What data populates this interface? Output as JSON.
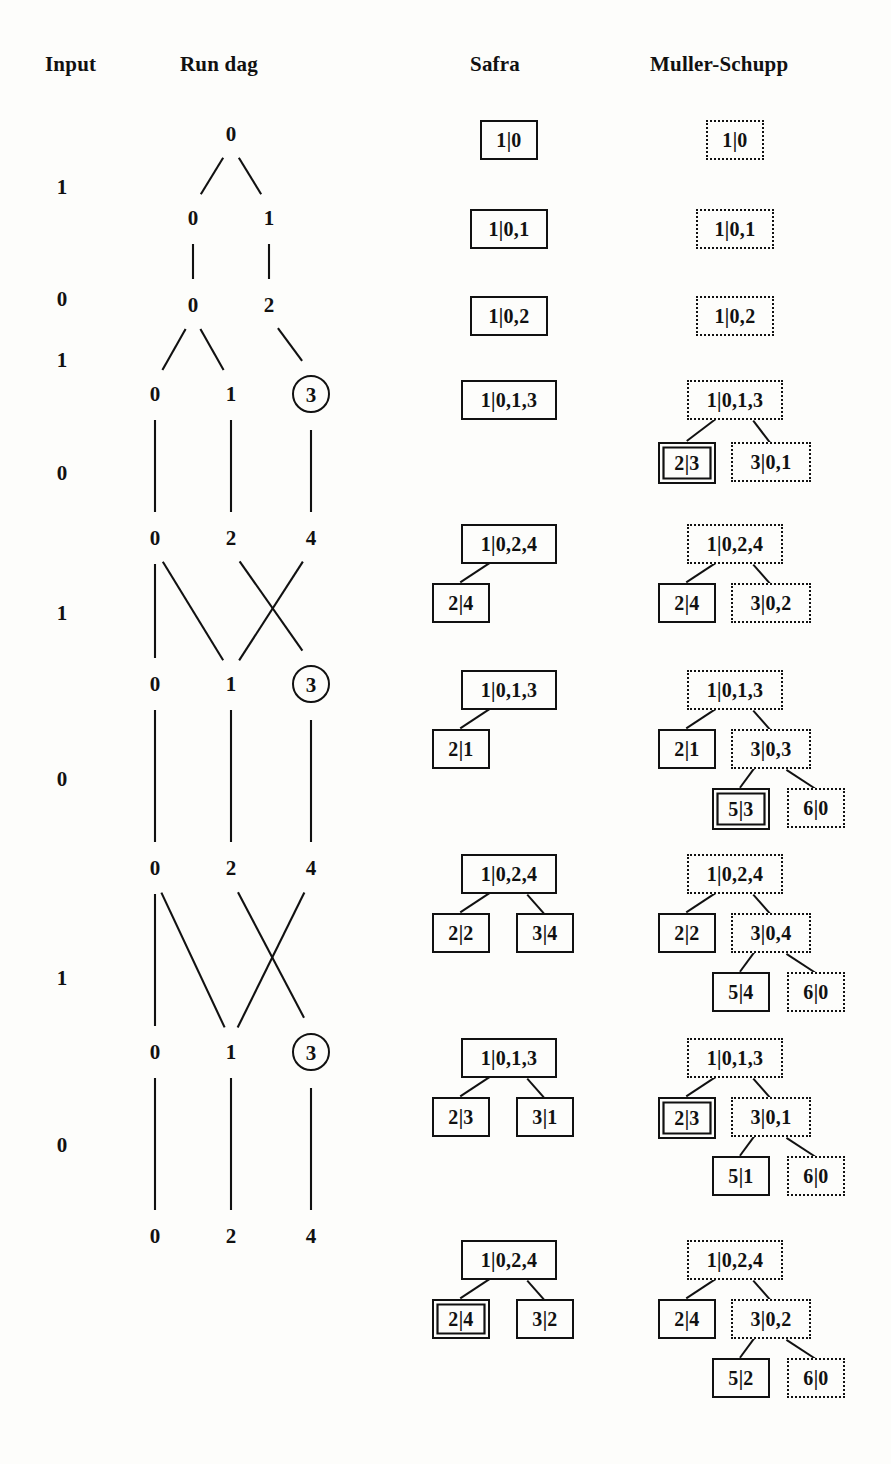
{
  "headers": [
    {
      "label": "Input",
      "x": 45,
      "y": 52
    },
    {
      "label": "Run dag",
      "x": 180,
      "y": 52
    },
    {
      "label": "Safra",
      "x": 470,
      "y": 52
    },
    {
      "label": "Muller-Schupp",
      "x": 650,
      "y": 52
    }
  ],
  "input": {
    "label": "Input",
    "sequence": [
      "1",
      "0",
      "1",
      "0",
      "1",
      "0",
      "1",
      "0"
    ],
    "letters": [
      {
        "v": "1",
        "x": 62,
        "y": 175
      },
      {
        "v": "0",
        "x": 62,
        "y": 287
      },
      {
        "v": "1",
        "x": 62,
        "y": 348
      },
      {
        "v": "0",
        "x": 62,
        "y": 461
      },
      {
        "v": "1",
        "x": 62,
        "y": 601
      },
      {
        "v": "0",
        "x": 62,
        "y": 767
      },
      {
        "v": "1",
        "x": 62,
        "y": 966
      },
      {
        "v": "0",
        "x": 62,
        "y": 1133
      }
    ]
  },
  "run_dag": {
    "label": "Run dag",
    "columns_x": [
      155,
      231,
      311
    ],
    "nodes": [
      {
        "id": "n0",
        "v": "0",
        "x": 231,
        "y": 134,
        "circled": false
      },
      {
        "id": "n1a",
        "v": "0",
        "x": 193,
        "y": 218,
        "circled": false
      },
      {
        "id": "n1b",
        "v": "1",
        "x": 269,
        "y": 218,
        "circled": false
      },
      {
        "id": "n2a",
        "v": "0",
        "x": 193,
        "y": 305,
        "circled": false
      },
      {
        "id": "n2b",
        "v": "2",
        "x": 269,
        "y": 305,
        "circled": false
      },
      {
        "id": "n3a",
        "v": "0",
        "x": 155,
        "y": 394,
        "circled": false
      },
      {
        "id": "n3b",
        "v": "1",
        "x": 231,
        "y": 394,
        "circled": false
      },
      {
        "id": "n3c",
        "v": "3",
        "x": 311,
        "y": 394,
        "circled": true
      },
      {
        "id": "n4a",
        "v": "0",
        "x": 155,
        "y": 538,
        "circled": false
      },
      {
        "id": "n4b",
        "v": "2",
        "x": 231,
        "y": 538,
        "circled": false
      },
      {
        "id": "n4c",
        "v": "4",
        "x": 311,
        "y": 538,
        "circled": false
      },
      {
        "id": "n5a",
        "v": "0",
        "x": 155,
        "y": 684,
        "circled": false
      },
      {
        "id": "n5b",
        "v": "1",
        "x": 231,
        "y": 684,
        "circled": false
      },
      {
        "id": "n5c",
        "v": "3",
        "x": 311,
        "y": 684,
        "circled": true
      },
      {
        "id": "n6a",
        "v": "0",
        "x": 155,
        "y": 868,
        "circled": false
      },
      {
        "id": "n6b",
        "v": "2",
        "x": 231,
        "y": 868,
        "circled": false
      },
      {
        "id": "n6c",
        "v": "4",
        "x": 311,
        "y": 868,
        "circled": false
      },
      {
        "id": "n7a",
        "v": "0",
        "x": 155,
        "y": 1052,
        "circled": false
      },
      {
        "id": "n7b",
        "v": "1",
        "x": 231,
        "y": 1052,
        "circled": false
      },
      {
        "id": "n7c",
        "v": "3",
        "x": 311,
        "y": 1052,
        "circled": true
      },
      {
        "id": "n8a",
        "v": "0",
        "x": 155,
        "y": 1236,
        "circled": false
      },
      {
        "id": "n8b",
        "v": "2",
        "x": 231,
        "y": 1236,
        "circled": false
      },
      {
        "id": "n8c",
        "v": "4",
        "x": 311,
        "y": 1236,
        "circled": false
      }
    ],
    "edges": [
      [
        "n0",
        "n1a"
      ],
      [
        "n0",
        "n1b"
      ],
      [
        "n1a",
        "n2a"
      ],
      [
        "n1b",
        "n2b"
      ],
      [
        "n2a",
        "n3a"
      ],
      [
        "n2a",
        "n3b"
      ],
      [
        "n2b",
        "n3c"
      ],
      [
        "n3a",
        "n4a"
      ],
      [
        "n3b",
        "n4b"
      ],
      [
        "n3c",
        "n4c"
      ],
      [
        "n4a",
        "n5a"
      ],
      [
        "n4a",
        "n5b"
      ],
      [
        "n4b",
        "n5c"
      ],
      [
        "n4c",
        "n5b"
      ],
      [
        "n5a",
        "n6a"
      ],
      [
        "n5b",
        "n6b"
      ],
      [
        "n5c",
        "n6c"
      ],
      [
        "n6a",
        "n7a"
      ],
      [
        "n6a",
        "n7b"
      ],
      [
        "n6b",
        "n7c"
      ],
      [
        "n6c",
        "n7b"
      ],
      [
        "n7a",
        "n8a"
      ],
      [
        "n7b",
        "n8b"
      ],
      [
        "n7c",
        "n8c"
      ]
    ]
  },
  "safra": {
    "label": "Safra",
    "trees": [
      {
        "nodes": [
          {
            "t": "1|0",
            "x": 480,
            "y": 120,
            "w": 58,
            "h": 40,
            "style": "solid"
          }
        ],
        "edges": []
      },
      {
        "nodes": [
          {
            "t": "1|0,1",
            "x": 470,
            "y": 209,
            "w": 78,
            "h": 40,
            "style": "solid"
          }
        ],
        "edges": []
      },
      {
        "nodes": [
          {
            "t": "1|0,2",
            "x": 470,
            "y": 296,
            "w": 78,
            "h": 40,
            "style": "solid"
          }
        ],
        "edges": []
      },
      {
        "nodes": [
          {
            "t": "1|0,1,3",
            "x": 461,
            "y": 380,
            "w": 96,
            "h": 40,
            "style": "solid"
          }
        ],
        "edges": []
      },
      {
        "nodes": [
          {
            "t": "1|0,2,4",
            "x": 461,
            "y": 524,
            "w": 96,
            "h": 40,
            "style": "solid"
          },
          {
            "t": "2|4",
            "x": 432,
            "y": 583,
            "w": 58,
            "h": 40,
            "style": "solid"
          }
        ],
        "edges": [
          [
            0,
            1
          ]
        ]
      },
      {
        "nodes": [
          {
            "t": "1|0,1,3",
            "x": 461,
            "y": 670,
            "w": 96,
            "h": 40,
            "style": "solid"
          },
          {
            "t": "2|1",
            "x": 432,
            "y": 729,
            "w": 58,
            "h": 40,
            "style": "solid"
          }
        ],
        "edges": [
          [
            0,
            1
          ]
        ]
      },
      {
        "nodes": [
          {
            "t": "1|0,2,4",
            "x": 461,
            "y": 854,
            "w": 96,
            "h": 40,
            "style": "solid"
          },
          {
            "t": "2|2",
            "x": 432,
            "y": 913,
            "w": 58,
            "h": 40,
            "style": "solid"
          },
          {
            "t": "3|4",
            "x": 516,
            "y": 913,
            "w": 58,
            "h": 40,
            "style": "solid"
          }
        ],
        "edges": [
          [
            0,
            1
          ],
          [
            0,
            2
          ]
        ]
      },
      {
        "nodes": [
          {
            "t": "1|0,1,3",
            "x": 461,
            "y": 1038,
            "w": 96,
            "h": 40,
            "style": "solid"
          },
          {
            "t": "2|3",
            "x": 432,
            "y": 1097,
            "w": 58,
            "h": 40,
            "style": "solid"
          },
          {
            "t": "3|1",
            "x": 516,
            "y": 1097,
            "w": 58,
            "h": 40,
            "style": "solid"
          }
        ],
        "edges": [
          [
            0,
            1
          ],
          [
            0,
            2
          ]
        ]
      },
      {
        "nodes": [
          {
            "t": "1|0,2,4",
            "x": 461,
            "y": 1240,
            "w": 96,
            "h": 40,
            "style": "solid"
          },
          {
            "t": "2|4",
            "x": 432,
            "y": 1299,
            "w": 58,
            "h": 40,
            "style": "dbl"
          },
          {
            "t": "3|2",
            "x": 516,
            "y": 1299,
            "w": 58,
            "h": 40,
            "style": "solid"
          }
        ],
        "edges": [
          [
            0,
            1
          ],
          [
            0,
            2
          ]
        ]
      }
    ]
  },
  "muller_schupp": {
    "label": "Muller-Schupp",
    "trees": [
      {
        "nodes": [
          {
            "t": "1|0",
            "x": 706,
            "y": 120,
            "w": 58,
            "h": 40,
            "style": "dotted"
          }
        ],
        "edges": []
      },
      {
        "nodes": [
          {
            "t": "1|0,1",
            "x": 696,
            "y": 209,
            "w": 78,
            "h": 40,
            "style": "dotted"
          }
        ],
        "edges": []
      },
      {
        "nodes": [
          {
            "t": "1|0,2",
            "x": 696,
            "y": 296,
            "w": 78,
            "h": 40,
            "style": "dotted"
          }
        ],
        "edges": []
      },
      {
        "nodes": [
          {
            "t": "1|0,1,3",
            "x": 687,
            "y": 380,
            "w": 96,
            "h": 40,
            "style": "dotted"
          },
          {
            "t": "2|3",
            "x": 658,
            "y": 442,
            "w": 58,
            "h": 42,
            "style": "dbl"
          },
          {
            "t": "3|0,1",
            "x": 731,
            "y": 442,
            "w": 80,
            "h": 40,
            "style": "dotted"
          }
        ],
        "edges": [
          [
            0,
            1
          ],
          [
            0,
            2
          ]
        ]
      },
      {
        "nodes": [
          {
            "t": "1|0,2,4",
            "x": 687,
            "y": 524,
            "w": 96,
            "h": 40,
            "style": "dotted"
          },
          {
            "t": "2|4",
            "x": 658,
            "y": 583,
            "w": 58,
            "h": 40,
            "style": "solid"
          },
          {
            "t": "3|0,2",
            "x": 731,
            "y": 583,
            "w": 80,
            "h": 40,
            "style": "dotted"
          }
        ],
        "edges": [
          [
            0,
            1
          ],
          [
            0,
            2
          ]
        ]
      },
      {
        "nodes": [
          {
            "t": "1|0,1,3",
            "x": 687,
            "y": 670,
            "w": 96,
            "h": 40,
            "style": "dotted"
          },
          {
            "t": "2|1",
            "x": 658,
            "y": 729,
            "w": 58,
            "h": 40,
            "style": "solid"
          },
          {
            "t": "3|0,3",
            "x": 731,
            "y": 729,
            "w": 80,
            "h": 40,
            "style": "dotted"
          },
          {
            "t": "5|3",
            "x": 712,
            "y": 788,
            "w": 58,
            "h": 42,
            "style": "dbl"
          },
          {
            "t": "6|0",
            "x": 787,
            "y": 788,
            "w": 58,
            "h": 40,
            "style": "dotted"
          }
        ],
        "edges": [
          [
            0,
            1
          ],
          [
            0,
            2
          ],
          [
            2,
            3
          ],
          [
            2,
            4
          ]
        ]
      },
      {
        "nodes": [
          {
            "t": "1|0,2,4",
            "x": 687,
            "y": 854,
            "w": 96,
            "h": 40,
            "style": "dotted"
          },
          {
            "t": "2|2",
            "x": 658,
            "y": 913,
            "w": 58,
            "h": 40,
            "style": "solid"
          },
          {
            "t": "3|0,4",
            "x": 731,
            "y": 913,
            "w": 80,
            "h": 40,
            "style": "dotted"
          },
          {
            "t": "5|4",
            "x": 712,
            "y": 972,
            "w": 58,
            "h": 40,
            "style": "solid"
          },
          {
            "t": "6|0",
            "x": 787,
            "y": 972,
            "w": 58,
            "h": 40,
            "style": "dotted"
          }
        ],
        "edges": [
          [
            0,
            1
          ],
          [
            0,
            2
          ],
          [
            2,
            3
          ],
          [
            2,
            4
          ]
        ]
      },
      {
        "nodes": [
          {
            "t": "1|0,1,3",
            "x": 687,
            "y": 1038,
            "w": 96,
            "h": 40,
            "style": "dotted"
          },
          {
            "t": "2|3",
            "x": 658,
            "y": 1097,
            "w": 58,
            "h": 42,
            "style": "dbl"
          },
          {
            "t": "3|0,1",
            "x": 731,
            "y": 1097,
            "w": 80,
            "h": 40,
            "style": "dotted"
          },
          {
            "t": "5|1",
            "x": 712,
            "y": 1156,
            "w": 58,
            "h": 40,
            "style": "solid"
          },
          {
            "t": "6|0",
            "x": 787,
            "y": 1156,
            "w": 58,
            "h": 40,
            "style": "dotted"
          }
        ],
        "edges": [
          [
            0,
            1
          ],
          [
            0,
            2
          ],
          [
            2,
            3
          ],
          [
            2,
            4
          ]
        ]
      },
      {
        "nodes": [
          {
            "t": "1|0,2,4",
            "x": 687,
            "y": 1240,
            "w": 96,
            "h": 40,
            "style": "dotted"
          },
          {
            "t": "2|4",
            "x": 658,
            "y": 1299,
            "w": 58,
            "h": 40,
            "style": "solid"
          },
          {
            "t": "3|0,2",
            "x": 731,
            "y": 1299,
            "w": 80,
            "h": 40,
            "style": "dotted"
          },
          {
            "t": "5|2",
            "x": 712,
            "y": 1358,
            "w": 58,
            "h": 40,
            "style": "solid"
          },
          {
            "t": "6|0",
            "x": 787,
            "y": 1358,
            "w": 58,
            "h": 40,
            "style": "dotted"
          }
        ],
        "edges": [
          [
            0,
            1
          ],
          [
            0,
            2
          ],
          [
            2,
            3
          ],
          [
            2,
            4
          ]
        ]
      }
    ]
  }
}
